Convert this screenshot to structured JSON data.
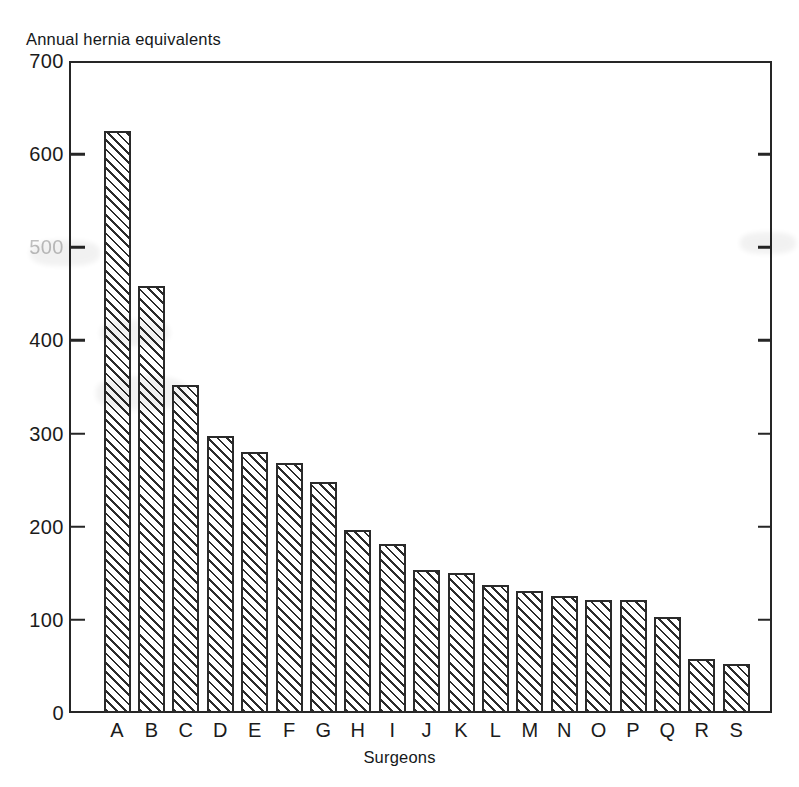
{
  "chart_data": {
    "type": "bar",
    "title": "Annual hernia equivalents",
    "xlabel": "Surgeons",
    "ylabel": "Annual hernia equivalents",
    "categories": [
      "A",
      "B",
      "C",
      "D",
      "E",
      "F",
      "G",
      "H",
      "I",
      "J",
      "K",
      "L",
      "M",
      "N",
      "O",
      "P",
      "Q",
      "R",
      "S"
    ],
    "values": [
      625,
      458,
      352,
      297,
      280,
      268,
      248,
      197,
      181,
      153,
      150,
      137,
      131,
      126,
      121,
      121,
      103,
      58,
      53
    ],
    "ylim": [
      0,
      700
    ],
    "ytick_labels": [
      "700",
      "600",
      "500",
      "400",
      "300",
      "200",
      "100",
      "0"
    ],
    "ytick_values": [
      700,
      600,
      500,
      400,
      300,
      200,
      100,
      0
    ],
    "grid": false,
    "legend": null,
    "bar_fill": "diagonal-hatch",
    "colors": {
      "ink": "#262626",
      "paper": "#ffffff",
      "faded_label": "#9a9a9a"
    }
  },
  "axes": {
    "y_title": "Annual hernia equivalents",
    "x_title": "Surgeons"
  }
}
